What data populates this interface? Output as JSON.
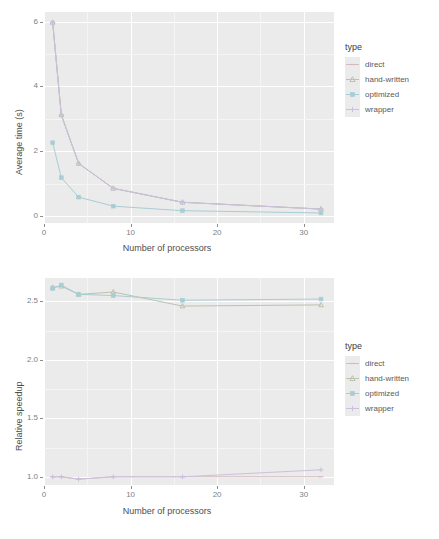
{
  "figure": {
    "panels": [
      "average-time",
      "relative-speedup"
    ]
  },
  "legend": {
    "title": "type",
    "entries": [
      {
        "label": "direct",
        "color": "#d4b9bd",
        "shape": "dash"
      },
      {
        "label": "hand-written",
        "color": "#bcc2b0",
        "shape": "triangle"
      },
      {
        "label": "optimized",
        "color": "#a8cdd4",
        "shape": "square"
      },
      {
        "label": "wrapper",
        "color": "#cbc0dd",
        "shape": "plus"
      }
    ]
  },
  "chart_data": [
    {
      "type": "line",
      "title": "",
      "xlabel": "Number of processors",
      "ylabel": "Average time (s)",
      "xlim": [
        0,
        33.5
      ],
      "ylim": [
        -0.22,
        6.3
      ],
      "xticks": [
        0,
        10,
        20,
        30
      ],
      "xticklabels": [
        "0",
        "10",
        "20",
        "30"
      ],
      "yticks": [
        0,
        2,
        4,
        6
      ],
      "yticklabels": [
        "0",
        "2",
        "4",
        "6"
      ],
      "grid": true,
      "legend": "right",
      "x": [
        1,
        2,
        4,
        8,
        16,
        32
      ],
      "series": [
        {
          "name": "direct",
          "values": [
            5.98,
            3.12,
            1.62,
            0.85,
            0.42,
            0.21
          ]
        },
        {
          "name": "hand-written",
          "values": [
            5.98,
            3.12,
            1.62,
            0.85,
            0.42,
            0.21
          ]
        },
        {
          "name": "optimized",
          "values": [
            2.26,
            1.18,
            0.58,
            0.3,
            0.16,
            0.09
          ]
        },
        {
          "name": "wrapper",
          "values": [
            5.98,
            3.12,
            1.62,
            0.85,
            0.42,
            0.21
          ]
        }
      ]
    },
    {
      "type": "line",
      "title": "",
      "xlabel": "Number of processors",
      "ylabel": "Relative speedup",
      "xlim": [
        0,
        33.5
      ],
      "ylim": [
        0.93,
        2.7
      ],
      "xticks": [
        0,
        10,
        20,
        30
      ],
      "xticklabels": [
        "0",
        "10",
        "20",
        "30"
      ],
      "yticks": [
        1.0,
        1.5,
        2.0,
        2.5
      ],
      "yticklabels": [
        "1.0",
        "1.5",
        "2.0",
        "2.5"
      ],
      "grid": true,
      "legend": "right",
      "x": [
        1,
        2,
        4,
        8,
        16,
        32
      ],
      "series": [
        {
          "name": "direct",
          "values": [
            1.0,
            1.0,
            0.98,
            1.0,
            1.0,
            1.0
          ]
        },
        {
          "name": "hand-written",
          "values": [
            2.62,
            2.63,
            2.56,
            2.58,
            2.46,
            2.47
          ]
        },
        {
          "name": "optimized",
          "values": [
            2.61,
            2.64,
            2.56,
            2.55,
            2.51,
            2.52
          ]
        },
        {
          "name": "wrapper",
          "values": [
            1.0,
            1.0,
            0.98,
            1.0,
            1.0,
            1.06
          ]
        }
      ]
    }
  ]
}
